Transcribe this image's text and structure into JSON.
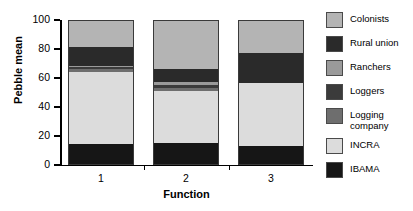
{
  "chart_data": {
    "type": "bar",
    "subtype": "stacked-vertical",
    "title": "",
    "xlabel": "Function",
    "ylabel": "Pebble mean",
    "categories": [
      "1",
      "2",
      "3"
    ],
    "ylim": [
      0,
      100
    ],
    "yticks": [
      0,
      20,
      40,
      60,
      80,
      100
    ],
    "ytick_labels": [
      "0",
      "20",
      "40",
      "60",
      "80",
      "100"
    ],
    "grid": false,
    "legend_position": "right",
    "stack_order_bottom_to_top": [
      "IBAMA",
      "INCRA",
      "Logging company",
      "Loggers",
      "Ranchers",
      "Rural union",
      "Colonists"
    ],
    "series": [
      {
        "name": "IBAMA",
        "color": "#161616",
        "values": [
          15,
          16,
          14
        ]
      },
      {
        "name": "INCRA",
        "color": "#dcdcdc",
        "values": [
          50,
          36,
          43
        ]
      },
      {
        "name": "Logging company",
        "color": "#6e6e6e",
        "values": [
          2,
          2,
          0
        ]
      },
      {
        "name": "Loggers",
        "color": "#3b3b3b",
        "values": [
          1,
          2,
          0
        ]
      },
      {
        "name": "Ranchers",
        "color": "#9a9a9a",
        "values": [
          1,
          2,
          0
        ]
      },
      {
        "name": "Rural union",
        "color": "#2a2a2a",
        "values": [
          13,
          9,
          21
        ]
      },
      {
        "name": "Colonists",
        "color": "#b4b4b4",
        "values": [
          18,
          33,
          22
        ]
      }
    ],
    "cumulative_tops": {
      "1": [
        15,
        65,
        67,
        68,
        69,
        82,
        100
      ],
      "2": [
        16,
        52,
        54,
        56,
        58,
        67,
        100
      ],
      "3": [
        14,
        57,
        57,
        57,
        57,
        78,
        100
      ]
    }
  },
  "legend": {
    "items": [
      {
        "label": "Colonists",
        "color": "#b4b4b4"
      },
      {
        "label": "Rural union",
        "color": "#2a2a2a"
      },
      {
        "label": "Ranchers",
        "color": "#9a9a9a"
      },
      {
        "label": "Loggers",
        "color": "#3b3b3b"
      },
      {
        "label": "Logging\ncompany",
        "color": "#6e6e6e"
      },
      {
        "label": "INCRA",
        "color": "#dcdcdc"
      },
      {
        "label": "IBAMA",
        "color": "#161616"
      }
    ]
  }
}
